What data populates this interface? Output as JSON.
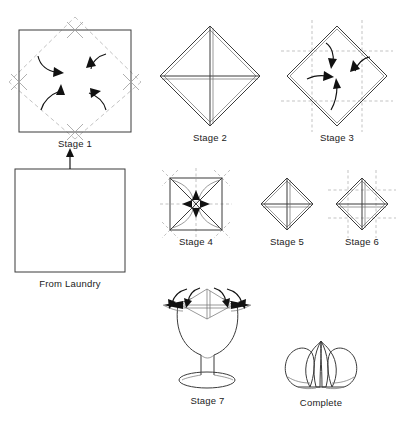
{
  "document": {
    "title": "Napkin Folding Instructions",
    "kind": "step-by-step-illustration",
    "background_color": "#ffffff",
    "line_color": "#3b3b3b",
    "fold_line_color": "#b3b3b3",
    "arrow_color": "#111111",
    "text_color": "#222222"
  },
  "steps": [
    {
      "id": "from-laundry",
      "label": "From Laundry",
      "shape": "plain-square",
      "description": "Flat unfolded square napkin"
    },
    {
      "id": "stage-1",
      "label": "Stage 1",
      "shape": "square-with-diagonal-fold-lines",
      "arrows": 4,
      "crosshairs": 4,
      "description": "Square with dashed diamond fold lines; four corners folded to center"
    },
    {
      "id": "stage-2",
      "label": "Stage 2",
      "shape": "diamond-with-cross",
      "arrows": 0,
      "description": "Diamond formed after corners folded in, centre cross visible"
    },
    {
      "id": "stage-3",
      "label": "Stage 3",
      "shape": "diamond-with-dashed-grid",
      "arrows": 4,
      "description": "Diamond with dashed grid fold guides; corners folded to centre again"
    },
    {
      "id": "stage-4",
      "label": "Stage 4",
      "shape": "square-with-diagonals",
      "arrows": 4,
      "crosshairs": 4,
      "description": "Smaller square; corners folded to centre along diagonals"
    },
    {
      "id": "stage-5",
      "label": "Stage 5",
      "shape": "small-diamond-with-cross",
      "arrows": 0,
      "description": "Smaller diamond with cross"
    },
    {
      "id": "stage-6",
      "label": "Stage 6",
      "shape": "small-diamond-with-cross-and-grid",
      "arrows": 0,
      "description": "Smaller diamond with cross and dashed grid"
    },
    {
      "id": "stage-7",
      "label": "Stage 7",
      "shape": "wine-glass-with-napkin",
      "arrows": 4,
      "description": "Folded napkin placed on a wine glass; petals pulled outward"
    },
    {
      "id": "complete",
      "label": "Complete",
      "shape": "lotus-flower",
      "arrows": 0,
      "description": "Finished lotus flower napkin fold"
    }
  ],
  "flow": {
    "arrow_from": "From Laundry",
    "arrow_to": "Stage 1",
    "direction": "up"
  }
}
